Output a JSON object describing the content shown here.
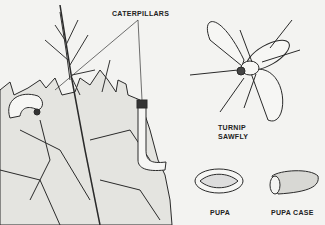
{
  "illustration": {
    "labels": {
      "caterpillars": "CATERPILLARS",
      "sawfly_line1": "TURNIP",
      "sawfly_line2": "SAWFLY",
      "pupa": "PUPA",
      "pupa_case": "PUPA CASE"
    },
    "colors": {
      "background": "#f3f3f1",
      "ink": "#2a2a2a",
      "leaf_fill": "#e4e4e0"
    }
  }
}
